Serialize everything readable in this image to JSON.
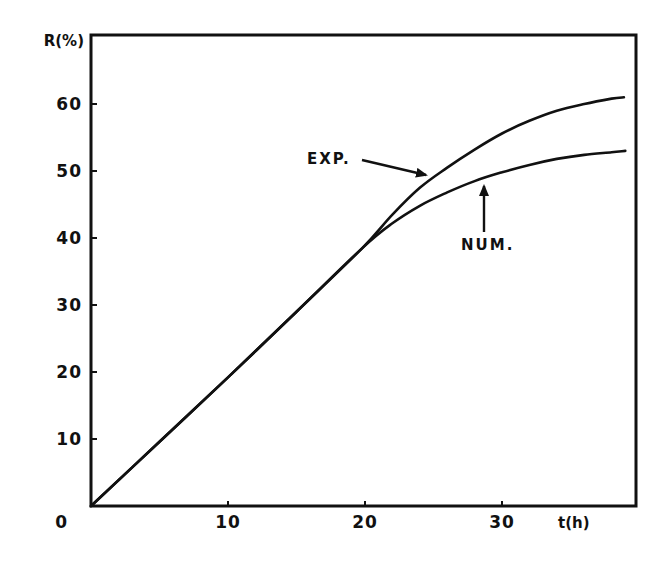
{
  "chart_data": {
    "type": "line",
    "title": "",
    "xlabel": "t(h)",
    "ylabel": "R(%)",
    "xlim": [
      0,
      39.8
    ],
    "ylim": [
      0,
      70
    ],
    "x_ticks": [
      10,
      20,
      30
    ],
    "y_ticks": [
      0,
      10,
      20,
      30,
      40,
      50,
      60
    ],
    "grid": false,
    "legend": "none (curves labeled by arrow annotations)",
    "series": [
      {
        "name": "EXP.",
        "x": [
          0,
          5,
          10,
          15,
          19.8,
          22,
          24,
          26,
          28,
          30,
          32,
          34,
          36,
          38,
          38.9
        ],
        "y": [
          0,
          9.6,
          19.2,
          29,
          38.5,
          43.5,
          47.5,
          50.5,
          53.2,
          55.6,
          57.5,
          59.0,
          60.0,
          60.8,
          61.0
        ]
      },
      {
        "name": "NUM.",
        "x": [
          0,
          5,
          10,
          15,
          19.8,
          22,
          24,
          26,
          28,
          30,
          32,
          34,
          36,
          38,
          39.0
        ],
        "y": [
          0,
          9.6,
          19.2,
          29,
          38.5,
          42.2,
          44.8,
          46.8,
          48.5,
          49.8,
          50.9,
          51.8,
          52.4,
          52.8,
          53.0
        ]
      }
    ],
    "annotations": [
      {
        "text": "EXP.",
        "points_to": "EXP. curve at t≈24.5, R≈48"
      },
      {
        "text": "NUM.",
        "points_to": "NUM. curve at t≈28.6, R≈48.5"
      }
    ]
  },
  "labels": {
    "ylabel": "R(%)",
    "xlabel": "t(h)",
    "x_tick_labels": [
      "10",
      "20",
      "30"
    ],
    "y_tick_labels": [
      "0",
      "10",
      "20",
      "30",
      "40",
      "50",
      "60"
    ],
    "annot_exp": "EXP.",
    "annot_num": "NUM."
  }
}
